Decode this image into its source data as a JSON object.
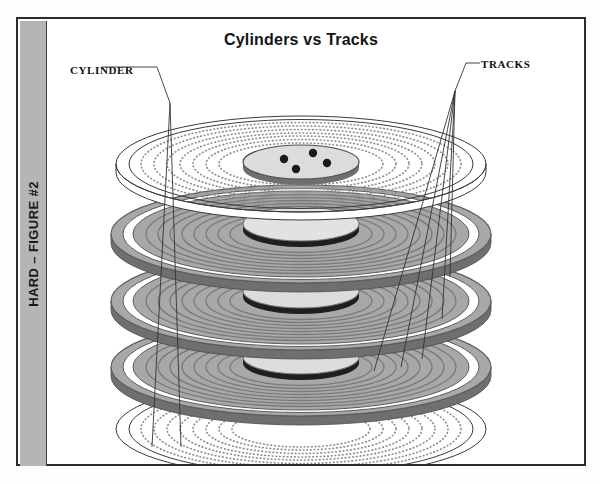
{
  "page": {
    "sidebar_label": "HARD – FIGURE #2",
    "title": "Cylinders vs Tracks"
  },
  "labels": {
    "cylinder": "CYLINDER",
    "tracks": "TRACKS"
  },
  "colors": {
    "sidebar_band": "#b5b5b5",
    "frame_border": "#2b2b2b",
    "platter_gray_fill": "#a8a8a8",
    "platter_gray_track": "#787878",
    "platter_rim_dark": "#6f6f6f",
    "platter_white_fill": "#ffffff",
    "hub_fill": "#d9d9d9",
    "hub_edge": "#8a8a8a",
    "spindle_dot": "#1a1a1a",
    "leader_line": "#333333",
    "dotted_track": "#8f8f8f"
  },
  "diagram": {
    "type": "disk-platter-stack",
    "platter_count": 5,
    "platters": [
      {
        "index": 0,
        "style": "dotted-white",
        "cy": 145,
        "rx": 185,
        "ry": 48,
        "tracks": 9
      },
      {
        "index": 1,
        "style": "solid-gray",
        "cy": 215,
        "rx": 190,
        "ry": 49,
        "tracks": 9
      },
      {
        "index": 2,
        "style": "solid-gray",
        "cy": 282,
        "rx": 190,
        "ry": 49,
        "tracks": 9
      },
      {
        "index": 3,
        "style": "solid-gray",
        "cy": 348,
        "rx": 190,
        "ry": 49,
        "tracks": 9
      },
      {
        "index": 4,
        "style": "dotted-white",
        "cy": 410,
        "rx": 185,
        "ry": 48,
        "tracks": 9
      }
    ],
    "hub": {
      "rx": 58,
      "ry": 17,
      "spindle_dots": 4
    },
    "cylinder_lines": 2,
    "track_leader_lines": 5
  }
}
